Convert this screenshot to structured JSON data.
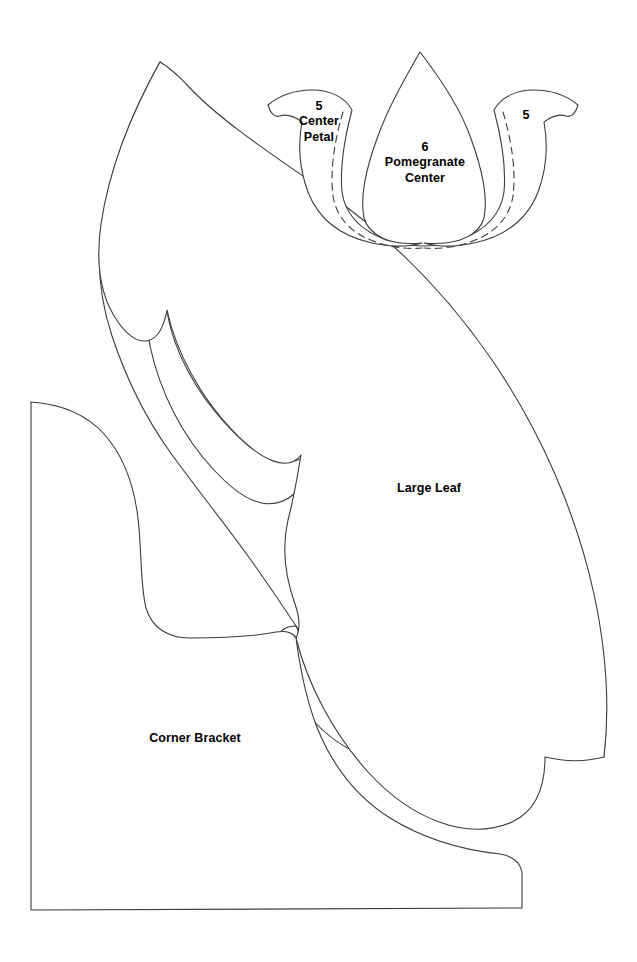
{
  "sheet": {
    "title": "Appliqué Pattern Template Sheet",
    "background_color": "#ffffff",
    "stroke_color": "#3c3c3c",
    "label_color": "#000000",
    "width": 637,
    "height": 962
  },
  "pieces": [
    {
      "id": "center-petal",
      "number": "5",
      "name": "Center\nPetal",
      "label": "5\nCenter\nPetal",
      "has_seam_guide": true,
      "seam_guide_style": "dashed"
    },
    {
      "id": "pomegranate-center",
      "number": "6",
      "name": "Pomegranate\nCenter",
      "label": "6\nPomegranate\nCenter",
      "has_seam_guide": false,
      "seam_guide_style": "none"
    },
    {
      "id": "right-petal",
      "number": "5",
      "name": "",
      "label": "5",
      "has_seam_guide": true,
      "seam_guide_style": "dashed"
    },
    {
      "id": "large-leaf",
      "number": "",
      "name": "Large Leaf",
      "label": "Large Leaf",
      "has_seam_guide": false,
      "seam_guide_style": "none"
    },
    {
      "id": "corner-bracket",
      "number": "",
      "name": "Corner Bracket",
      "label": "Corner Bracket",
      "has_seam_guide": false,
      "seam_guide_style": "none"
    }
  ]
}
